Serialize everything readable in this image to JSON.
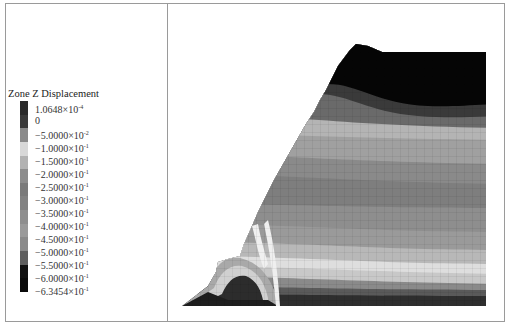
{
  "legend": {
    "title": "Zone Z Displacement",
    "entries": [
      {
        "mantissa": "1.0648",
        "exp": "-4",
        "plain": ""
      },
      {
        "mantissa": "",
        "exp": "",
        "plain": "0"
      },
      {
        "mantissa": "−5.0000",
        "exp": "-2",
        "plain": ""
      },
      {
        "mantissa": "−1.0000",
        "exp": "-1",
        "plain": ""
      },
      {
        "mantissa": "−1.5000",
        "exp": "-1",
        "plain": ""
      },
      {
        "mantissa": "−2.0000",
        "exp": "-1",
        "plain": ""
      },
      {
        "mantissa": "−2.5000",
        "exp": "-1",
        "plain": ""
      },
      {
        "mantissa": "−3.0000",
        "exp": "-1",
        "plain": ""
      },
      {
        "mantissa": "−3.5000",
        "exp": "-1",
        "plain": ""
      },
      {
        "mantissa": "−4.0000",
        "exp": "-1",
        "plain": ""
      },
      {
        "mantissa": "−4.5000",
        "exp": "-1",
        "plain": ""
      },
      {
        "mantissa": "−5.0000",
        "exp": "-1",
        "plain": ""
      },
      {
        "mantissa": "−5.5000",
        "exp": "-1",
        "plain": ""
      },
      {
        "mantissa": "−6.0000",
        "exp": "-1",
        "plain": ""
      },
      {
        "mantissa": "−6.3454",
        "exp": "-1",
        "plain": ""
      }
    ],
    "times_symbol": "×10",
    "swatch_colors": [
      "#2a2a2a",
      "#3a3a3a",
      "#8a8a8a",
      "#d8d8d8",
      "#b2b2b2",
      "#8c8c8c",
      "#7a7a7a",
      "#828282",
      "#8e8e8e",
      "#9a9a9a",
      "#8a8a8a",
      "#5e5e5e",
      "#111111",
      "#0a0a0a"
    ]
  },
  "plot": {
    "type": "contour",
    "description": "Slope model cross-section with Z-displacement contour bands and zone mesh"
  }
}
